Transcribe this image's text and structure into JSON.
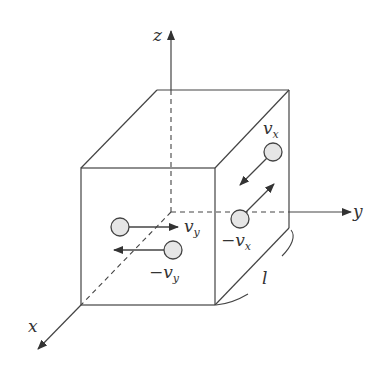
{
  "diagram": {
    "axes": {
      "x": {
        "label": "x"
      },
      "y": {
        "label": "y"
      },
      "z": {
        "label": "z"
      }
    },
    "edge_label": "l",
    "molecules": [
      {
        "id": "vy-pos",
        "label_main": "v",
        "label_sub": "y",
        "prefix": "",
        "direction": "+y"
      },
      {
        "id": "vy-neg",
        "label_main": "v",
        "label_sub": "y",
        "prefix": "−",
        "direction": "−y"
      },
      {
        "id": "vx-pos",
        "label_main": "v",
        "label_sub": "x",
        "prefix": "",
        "direction": "+x"
      },
      {
        "id": "vx-neg",
        "label_main": "v",
        "label_sub": "x",
        "prefix": "−",
        "direction": "−x"
      }
    ],
    "colors": {
      "stroke": "#333333",
      "molecule_fill": "#e6e6e6",
      "background": "#ffffff"
    }
  }
}
